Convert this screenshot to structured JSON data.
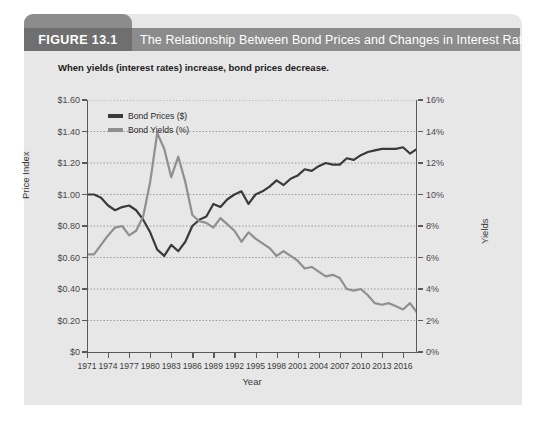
{
  "figure": {
    "number_label": "FIGURE 13.1",
    "title": "The Relationship Between Bond Prices and Changes in Interest Rates",
    "subtitle": "When yields (interest rates) increase, bond prices decrease."
  },
  "colors": {
    "banner_bg": "#8c8c8c",
    "banner_tab_bg": "#6f6f6f",
    "card_bg": "#e7e7e7",
    "prices_line": "#3a3a3a",
    "yields_line": "#8f8f8f",
    "gridline": "#9a9a9a",
    "axis": "#5a5a5a"
  },
  "chart_data": {
    "type": "line",
    "title": "The Relationship Between Bond Prices and Changes in Interest Rates",
    "subtitle": "When yields (interest rates) increase, bond prices decrease.",
    "xlabel": "Year",
    "ylabel": "Price Index",
    "y2label": "Yields",
    "grid": true,
    "legend_position": "top-left",
    "xlim": [
      1971,
      2018
    ],
    "ylim": [
      0,
      1.6
    ],
    "y2lim": [
      0,
      0.16
    ],
    "xticks": [
      1971,
      1974,
      1977,
      1980,
      1983,
      1986,
      1989,
      1992,
      1995,
      1998,
      2001,
      2004,
      2007,
      2010,
      2013,
      2016
    ],
    "xtick_labels": [
      "1971",
      "1974",
      "1977",
      "1980",
      "1983",
      "1986",
      "1989",
      "1992",
      "1995",
      "1998",
      "2001",
      "2004",
      "2007",
      "2010",
      "2013",
      "2016"
    ],
    "yticks": [
      0,
      0.2,
      0.4,
      0.6,
      0.8,
      1.0,
      1.2,
      1.4,
      1.6
    ],
    "ytick_labels": [
      "$0",
      "$0.20",
      "$0.40",
      "$0.60",
      "$0.80",
      "$1.00",
      "$1.20",
      "$1.40",
      "$1.60"
    ],
    "y2ticks": [
      0,
      0.02,
      0.04,
      0.06,
      0.08,
      0.1,
      0.12,
      0.14,
      0.16
    ],
    "y2tick_labels": [
      "0%",
      "2%",
      "4%",
      "6%",
      "8%",
      "10%",
      "12%",
      "14%",
      "16%"
    ],
    "x": [
      1971,
      1972,
      1973,
      1974,
      1975,
      1976,
      1977,
      1978,
      1979,
      1980,
      1981,
      1982,
      1983,
      1984,
      1985,
      1986,
      1987,
      1988,
      1989,
      1990,
      1991,
      1992,
      1993,
      1994,
      1995,
      1996,
      1997,
      1998,
      1999,
      2000,
      2001,
      2002,
      2003,
      2004,
      2005,
      2006,
      2007,
      2008,
      2009,
      2010,
      2011,
      2012,
      2013,
      2014,
      2015,
      2016,
      2017,
      2018
    ],
    "series": [
      {
        "name": "Bond Prices ($)",
        "axis": "left",
        "unit": "$",
        "color": "#3a3a3a",
        "values": [
          1.0,
          1.0,
          0.98,
          0.93,
          0.9,
          0.92,
          0.93,
          0.9,
          0.84,
          0.76,
          0.65,
          0.61,
          0.68,
          0.64,
          0.7,
          0.8,
          0.84,
          0.86,
          0.94,
          0.92,
          0.97,
          1.0,
          1.02,
          0.94,
          1.0,
          1.02,
          1.05,
          1.09,
          1.06,
          1.1,
          1.12,
          1.16,
          1.15,
          1.18,
          1.2,
          1.19,
          1.19,
          1.23,
          1.22,
          1.25,
          1.27,
          1.28,
          1.29,
          1.29,
          1.29,
          1.3,
          1.26,
          1.29
        ]
      },
      {
        "name": "Bond Yields (%)",
        "axis": "right",
        "unit": "%",
        "color": "#8f8f8f",
        "values": [
          0.062,
          0.062,
          0.068,
          0.074,
          0.079,
          0.08,
          0.074,
          0.077,
          0.086,
          0.108,
          0.139,
          0.129,
          0.111,
          0.124,
          0.108,
          0.087,
          0.083,
          0.082,
          0.079,
          0.085,
          0.081,
          0.077,
          0.07,
          0.076,
          0.072,
          0.069,
          0.066,
          0.061,
          0.064,
          0.061,
          0.058,
          0.053,
          0.054,
          0.051,
          0.048,
          0.049,
          0.047,
          0.04,
          0.039,
          0.04,
          0.036,
          0.031,
          0.03,
          0.031,
          0.029,
          0.027,
          0.031,
          0.025
        ]
      }
    ]
  }
}
